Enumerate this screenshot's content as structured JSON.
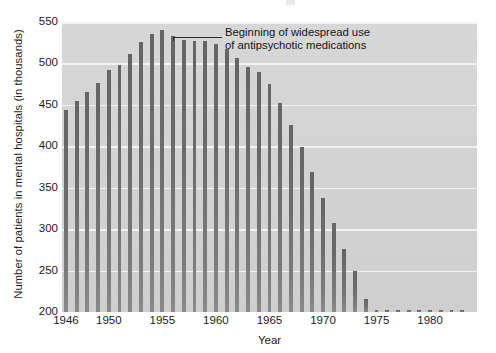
{
  "chart_data": {
    "type": "bar",
    "title": "",
    "xlabel": "Year",
    "ylabel": "Number of patients in mental hospitals (in thousands)",
    "ylim": [
      200,
      550
    ],
    "ytick_labels": [
      "550",
      "500",
      "450",
      "400",
      "350",
      "300",
      "250",
      "200"
    ],
    "ytick_values": [
      550,
      500,
      450,
      400,
      350,
      300,
      250,
      200
    ],
    "xtick_labels": [
      "1946",
      "1950",
      "1955",
      "1960",
      "1965",
      "1970",
      "1975",
      "1980"
    ],
    "xtick_values": [
      1946,
      1950,
      1955,
      1960,
      1965,
      1970,
      1975,
      1980
    ],
    "grid": true,
    "legend": "none",
    "categories": [
      1946,
      1947,
      1948,
      1949,
      1950,
      1951,
      1952,
      1953,
      1954,
      1955,
      1956,
      1957,
      1958,
      1959,
      1960,
      1961,
      1962,
      1963,
      1964,
      1965,
      1966,
      1967,
      1968,
      1969,
      1970,
      1971,
      1972,
      1973,
      1974,
      1975,
      1976,
      1977,
      1978,
      1979,
      1980,
      1981,
      1982,
      1983
    ],
    "values": [
      444,
      455,
      466,
      476,
      492,
      498,
      512,
      526,
      535,
      540,
      533,
      528,
      527,
      527,
      524,
      518,
      507,
      496,
      490,
      475,
      452,
      426,
      399,
      369,
      338,
      308,
      276,
      249,
      216,
      193,
      171,
      160,
      147,
      140,
      132,
      125,
      122,
      119
    ],
    "values_note": "bar heights read from axis; chart baseline is 200 so short final bars sit just above axis",
    "annotations": [
      {
        "text_line_1": "Beginning of widespread use",
        "text_line_2": "of antipsychotic medications",
        "points_at_year": 1956
      }
    ]
  }
}
